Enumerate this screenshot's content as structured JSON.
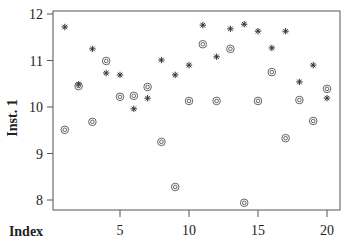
{
  "chart_data": {
    "type": "scatter",
    "title": "",
    "xlabel": "Index",
    "ylabel": "Inst. 1",
    "xlim": [
      0.2,
      20.9
    ],
    "ylim": [
      7.75,
      12.05
    ],
    "xticks": [
      5,
      10,
      15,
      20
    ],
    "yticks": [
      8,
      9,
      10,
      11,
      12
    ],
    "grid": false,
    "legend": null,
    "x": [
      1,
      2,
      3,
      4,
      5,
      6,
      7,
      8,
      9,
      10,
      11,
      12,
      13,
      14,
      15,
      16,
      17,
      18,
      19,
      20
    ],
    "series": [
      {
        "name": "series-star",
        "marker": "asterisk",
        "values": [
          11.72,
          10.49,
          11.25,
          10.73,
          10.69,
          9.96,
          10.19,
          11.01,
          10.69,
          10.9,
          11.76,
          11.08,
          11.68,
          11.78,
          11.63,
          11.27,
          11.63,
          10.54,
          10.9,
          10.19
        ]
      },
      {
        "name": "series-circle",
        "marker": "double-circle",
        "values": [
          9.51,
          10.45,
          9.68,
          10.99,
          10.22,
          10.24,
          10.43,
          9.25,
          8.28,
          10.13,
          11.35,
          10.13,
          11.25,
          7.94,
          10.13,
          10.75,
          9.33,
          10.15,
          9.7,
          10.39
        ]
      }
    ]
  },
  "labels": {
    "x_axis": "Index",
    "y_axis": "Inst. 1"
  }
}
